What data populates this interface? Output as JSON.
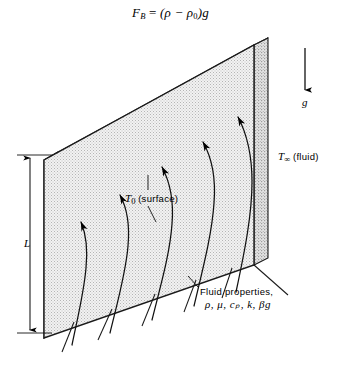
{
  "figure": {
    "title_equation": {
      "lhs_symbol": "F",
      "lhs_sub": "B",
      "equals": "=",
      "rhs": "(ρ − ρ",
      "rhs_sub": "0",
      "rhs_tail": ")g",
      "plain": "F_B = (ρ − ρ₀)g"
    },
    "labels": {
      "surface_temp_symbol": "T",
      "surface_temp_sub": "0",
      "surface_temp_suffix": "(surface)",
      "surface_temp_plain": "T₀ (surface)",
      "fluid_temp_symbol": "T",
      "fluid_temp_sub": "∞",
      "fluid_temp_suffix": "(fluid)",
      "fluid_temp_plain": "T∞ (fluid)",
      "gravity": "g",
      "height": "L",
      "fluid_properties_line1": "Fluid properties,",
      "fluid_properties_line2": "ρ, μ, cₚ, k, βg",
      "fluid_properties_symbols": [
        "ρ",
        "μ",
        "cₚ",
        "k",
        "βg"
      ]
    },
    "colors": {
      "ink": "#000000",
      "background": "#ffffff",
      "plate_face": "#ededed",
      "plate_top": "#d8d8d8",
      "plate_side": "#c9c9c9",
      "stipple": "#b8b8b8"
    },
    "geometry": {
      "plate_front_face": "parallelogram (44,160) (254,45) (254,265) (44,338)",
      "plate_top_edge_thickness_px": 9,
      "plate_side_edge_width_px": 14,
      "dimension_arrow": "double-headed vertical at x=30 from y=155 to y=332",
      "gravity_arrow": "downward at x=305 from y=48 to y=93",
      "flow_streamlines": 5,
      "boundary_rays": 6
    }
  }
}
